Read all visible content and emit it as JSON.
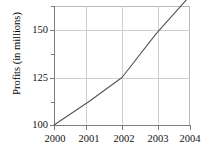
{
  "chart_data": {
    "type": "line",
    "title": "",
    "subtitle": "",
    "xlabel": "",
    "ylabel": "Profits (in millions)",
    "x": [
      2000,
      2001,
      2002,
      2003,
      2004
    ],
    "categories": [
      "2000",
      "2001",
      "2002",
      "2003",
      "2004"
    ],
    "values": [
      100,
      112,
      125,
      148,
      168
    ],
    "series": [
      {
        "name": "Profits",
        "values": [
          100,
          112,
          125,
          148,
          168
        ],
        "color": "#555555"
      }
    ],
    "xlim": [
      2000,
      2004
    ],
    "ylim": [
      100,
      170
    ],
    "xticks": [
      "2000",
      "2001",
      "2002",
      "2003",
      "2004"
    ],
    "yticks_major": [
      "100",
      "125",
      "150"
    ],
    "yticks_major_values": [
      100,
      125,
      150
    ],
    "yticks_minor_values": [
      112.5,
      137.5,
      162.5
    ],
    "grid": "on",
    "legend": "none",
    "annotations": []
  },
  "axis": {
    "y_title": "Profits (in millions)",
    "y_labels": [
      "150",
      "125",
      "100"
    ],
    "x_labels": [
      "2000",
      "2001",
      "2002",
      "2003",
      "2004"
    ]
  },
  "colors": {
    "line": "#555555",
    "grid": "#cfcfcf",
    "axis": "#7d7d7d",
    "frame": "#b9b9b9",
    "text": "#111111",
    "background": "#ffffff"
  }
}
